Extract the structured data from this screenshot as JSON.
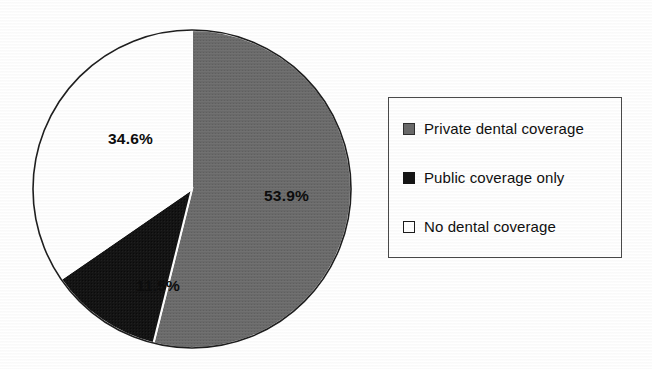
{
  "chart_data": {
    "type": "pie",
    "title": "",
    "subtitle": "",
    "xlabel": "",
    "ylabel": "",
    "grid": false,
    "legend_position": "right",
    "start_angle_deg": 0,
    "direction": "clockwise",
    "categories": [
      "Private dental coverage",
      "Public coverage only",
      "No dental coverage"
    ],
    "values": [
      53.9,
      11.5,
      34.6
    ],
    "value_labels": [
      "53.9%",
      "11.5%",
      "34.6%"
    ],
    "colors": [
      "#6a6a6a",
      "#141414",
      "#ffffff"
    ],
    "slices": [
      {
        "label": "Private dental coverage",
        "value": 53.9,
        "value_label": "53.9%",
        "color": "#6a6a6a",
        "start_deg": 0,
        "sweep_deg": 194.04,
        "label_text_color": "#0d0d0d"
      },
      {
        "label": "Public coverage only",
        "value": 11.5,
        "value_label": "11.5%",
        "color": "#141414",
        "start_deg": 194.04,
        "sweep_deg": 41.4,
        "label_text_color": "#0a0a0a"
      },
      {
        "label": "No dental coverage",
        "value": 34.6,
        "value_label": "34.6%",
        "color": "#ffffff",
        "start_deg": 235.44,
        "sweep_deg": 124.56,
        "label_text_color": "#0d0d0d"
      }
    ]
  },
  "pie": {
    "center_x": 160,
    "center_y": 163,
    "radius": 159,
    "outline_color": "#1f1f1f",
    "separator_color": "#ffffff",
    "labels": [
      {
        "text": "53.9%",
        "x": 232,
        "y": 175
      },
      {
        "text": "11.5%",
        "x": 104,
        "y": 265
      },
      {
        "text": "34.6%",
        "x": 76,
        "y": 118
      }
    ]
  },
  "legend": {
    "border_color": "#4a4a4a",
    "background": "#ffffff",
    "items": [
      {
        "label": "Private dental coverage",
        "swatch": "gray",
        "swatch_color": "#6a6a6a"
      },
      {
        "label": "Public coverage only",
        "swatch": "black",
        "swatch_color": "#141414"
      },
      {
        "label": "No dental coverage",
        "swatch": "white",
        "swatch_color": "#ffffff"
      }
    ]
  }
}
